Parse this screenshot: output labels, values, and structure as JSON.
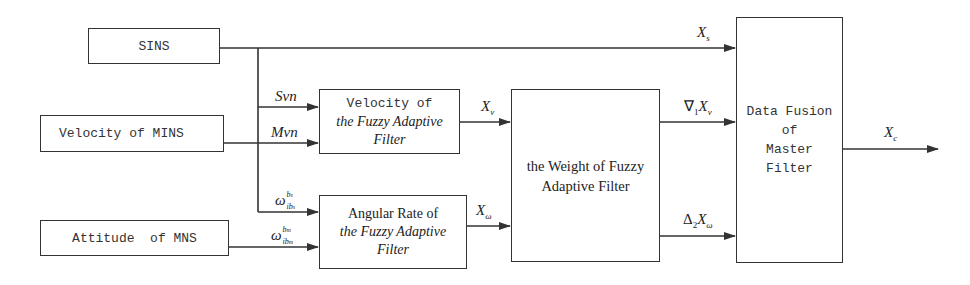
{
  "boxes": {
    "sins": "SINS",
    "velocity_mins": "Velocity of MINS",
    "attitude_mns": "Attitude  of MNS",
    "velocity_filter": {
      "line1": "Velocity of",
      "line2": "the Fuzzy Adaptive",
      "line3": "Filter"
    },
    "angular_filter": {
      "line1": "Angular Rate of",
      "line2": "the Fuzzy Adaptive",
      "line3": "Filter"
    },
    "weight_filter": {
      "line1": "the Weight of Fuzzy",
      "line2": "Adaptive Filter"
    },
    "master_filter": {
      "line1": "Data Fusion",
      "line2": "of",
      "line3": "Master",
      "line4": "Filter"
    }
  },
  "signals": {
    "xs": {
      "base": "X",
      "sub": "s"
    },
    "svn": "Svn",
    "mvn": "Mvn",
    "omega_s": {
      "base": "ω",
      "sup": "b",
      "supsub": "s",
      "sub": "ib",
      "subsub": "s"
    },
    "omega_m": {
      "base": "ω",
      "sup": "b",
      "supsub": "m",
      "sub": "ib",
      "subsub": "m"
    },
    "xv": {
      "base": "X",
      "sub": "v"
    },
    "xomega": {
      "base": "X",
      "sub": "ω"
    },
    "grad1_xv": {
      "op": "∇",
      "opsub": "1",
      "base": "X",
      "sub": "v"
    },
    "delta2_xomega": {
      "op": "Δ",
      "opsub": "2",
      "base": "X",
      "sub": "ω"
    },
    "xc": {
      "base": "X",
      "sub": "c"
    }
  },
  "colors": {
    "line": "#333333",
    "background": "#ffffff"
  }
}
